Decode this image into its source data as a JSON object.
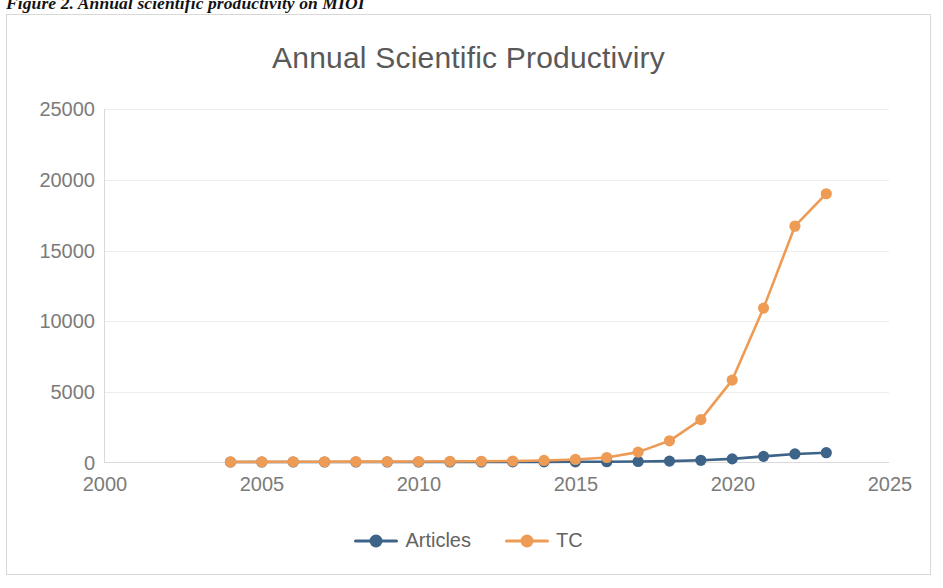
{
  "figure": {
    "caption": "Figure 2. Annual scientific productivity on MIOI"
  },
  "chart": {
    "title": "Annual Scientific Productiviry",
    "colors": {
      "articles": "#3E6388",
      "tc": "#ED9B55",
      "grid": "#ededed",
      "axis": "#d9d9d9",
      "text": "#7b7b7b",
      "title": "#595959"
    },
    "legend": [
      {
        "label": "Articles",
        "color": "#3E6388"
      },
      {
        "label": "TC",
        "color": "#ED9B55"
      }
    ]
  },
  "chart_data": {
    "type": "line",
    "title": "Annual Scientific Productiviry",
    "xlabel": "",
    "ylabel": "",
    "xlim": [
      2000,
      2025
    ],
    "ylim": [
      0,
      25000
    ],
    "grid": true,
    "legend_position": "bottom",
    "x_ticks": [
      "2000",
      "2005",
      "2010",
      "2015",
      "2020",
      "2025"
    ],
    "y_ticks": [
      "0",
      "5000",
      "10000",
      "15000",
      "20000",
      "25000"
    ],
    "x": [
      2004,
      2005,
      2006,
      2007,
      2008,
      2009,
      2010,
      2011,
      2012,
      2013,
      2014,
      2015,
      2016,
      2017,
      2018,
      2019,
      2020,
      2021,
      2022,
      2023
    ],
    "series": [
      {
        "name": "Articles",
        "color": "#3E6388",
        "values": [
          1,
          1,
          2,
          2,
          2,
          3,
          3,
          4,
          5,
          6,
          9,
          14,
          22,
          35,
          60,
          120,
          220,
          400,
          570,
          660
        ]
      },
      {
        "name": "TC",
        "color": "#ED9B55",
        "values": [
          5,
          10,
          15,
          20,
          25,
          30,
          35,
          45,
          55,
          70,
          110,
          180,
          320,
          700,
          1500,
          3000,
          5800,
          10900,
          16700,
          19000
        ]
      }
    ]
  }
}
